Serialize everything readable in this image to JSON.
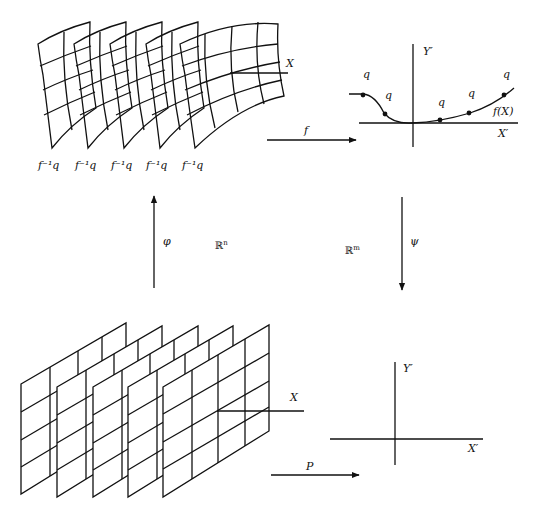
{
  "diagram": {
    "top_left": {
      "description": "Five warped grid sheets (level sets) in R^n",
      "sheet_labels": [
        "f⁻¹q",
        "f⁻¹q",
        "f⁻¹q",
        "f⁻¹q",
        "f⁻¹q"
      ],
      "axis_label": "X"
    },
    "top_right": {
      "y_axis_label": "Y′",
      "x_axis_label": "X′",
      "curve_label": "f(X)",
      "point_labels": [
        "q",
        "q",
        "q",
        "q",
        "q"
      ]
    },
    "arrows": {
      "top": "f",
      "left": "φ",
      "right": "ψ",
      "bottom": "P"
    },
    "spaces": {
      "left": "ℝ",
      "left_sup": "n",
      "right": "ℝ",
      "right_sup": "m"
    },
    "bottom_left": {
      "description": "Five flat parallelogram grid sheets",
      "axis_label": "X"
    },
    "bottom_right": {
      "y_axis_label": "Y′",
      "x_axis_label": "X′"
    }
  }
}
